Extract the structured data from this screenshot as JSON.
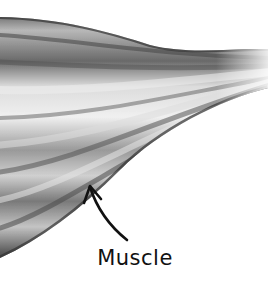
{
  "diagram": {
    "label": "Muscle",
    "colors": {
      "background": "#ffffff",
      "muscle_dark": "#3a3a3a",
      "muscle_mid": "#8a8a8a",
      "muscle_light": "#e8e8e8",
      "arrow": "#111111",
      "label": "#111111"
    }
  }
}
